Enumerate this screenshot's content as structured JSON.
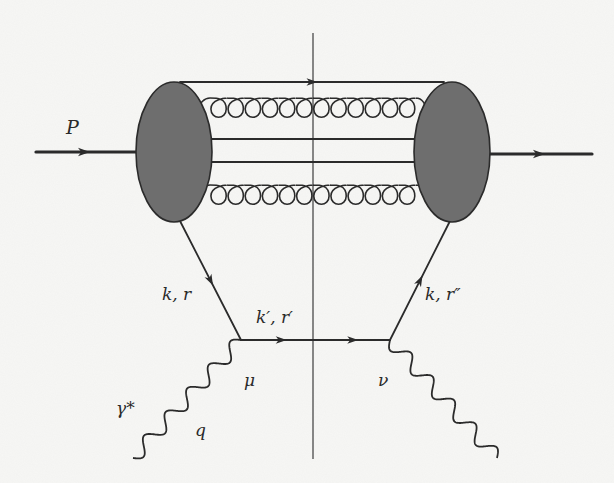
{
  "diagram": {
    "type": "feynman-diagram",
    "colors": {
      "line": "#2b2b2b",
      "blob_fill": "#6e6e6e",
      "blob_stroke": "#2b2b2b",
      "cut_line": "#4a4a4a",
      "background": "#f7f7f5"
    },
    "labels": {
      "incoming_proton": "P",
      "left_quark": "k, r",
      "middle_quark": "k′, r′",
      "right_quark": "k, r″",
      "left_vertex": "μ",
      "right_vertex": "ν",
      "photon": "γ*",
      "photon_momentum": "q"
    },
    "nodes": {
      "left_blob": {
        "cx": 174,
        "cy": 152,
        "rx": 38,
        "ry": 70
      },
      "right_blob": {
        "cx": 452,
        "cy": 152,
        "rx": 38,
        "ry": 70
      },
      "vertex_mu": {
        "x": 241,
        "y": 340
      },
      "vertex_nu": {
        "x": 390,
        "y": 340
      }
    },
    "edges": [
      {
        "id": "incoming-proton",
        "kind": "fermion-thick",
        "from": [
          36,
          152
        ],
        "to": [
          136,
          152
        ],
        "arrow": true
      },
      {
        "id": "outgoing-proton",
        "kind": "fermion-thick",
        "from": [
          490,
          154
        ],
        "to": [
          592,
          154
        ],
        "arrow": true
      },
      {
        "id": "spectator-top",
        "kind": "fermion",
        "from": [
          180,
          82
        ],
        "to": [
          444,
          82
        ],
        "arrow": true
      },
      {
        "id": "spectator-mid-1",
        "kind": "line",
        "from": [
          211,
          139
        ],
        "to": [
          416,
          139
        ]
      },
      {
        "id": "spectator-mid-2",
        "kind": "line",
        "from": [
          211,
          162
        ],
        "to": [
          416,
          162
        ]
      },
      {
        "id": "gluon-top",
        "kind": "gluon",
        "from": [
          204,
          109
        ],
        "to": [
          420,
          109
        ],
        "loops": 12
      },
      {
        "id": "gluon-bottom",
        "kind": "gluon",
        "from": [
          204,
          196
        ],
        "to": [
          420,
          196
        ],
        "loops": 12
      },
      {
        "id": "quark-k-r",
        "kind": "fermion",
        "from": [
          180,
          221
        ],
        "to": [
          241,
          340
        ],
        "arrow": true
      },
      {
        "id": "quark-kprime-rprime",
        "kind": "fermion",
        "from": [
          241,
          340
        ],
        "to": [
          390,
          340
        ],
        "arrows": 2
      },
      {
        "id": "quark-k-rdoubleprime",
        "kind": "fermion",
        "from": [
          390,
          340
        ],
        "to": [
          450,
          221
        ],
        "arrow": true
      },
      {
        "id": "photon-in",
        "kind": "photon",
        "from": [
          133,
          458
        ],
        "to": [
          241,
          340
        ],
        "waves": 5
      },
      {
        "id": "photon-out",
        "kind": "photon",
        "from": [
          390,
          340
        ],
        "to": [
          497,
          458
        ],
        "waves": 5
      }
    ],
    "cut": {
      "x": 313,
      "y1": 33,
      "y2": 459
    }
  }
}
